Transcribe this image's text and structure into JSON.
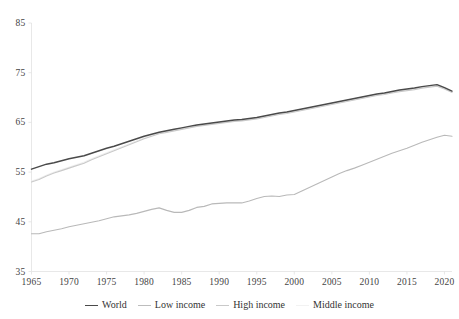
{
  "chart_data": {
    "type": "line",
    "title": "",
    "subtitle": "",
    "xlabel": "",
    "ylabel": "",
    "xlim": [
      1965,
      2021
    ],
    "ylim": [
      35,
      85
    ],
    "grid": false,
    "legend_position": "bottom",
    "x_ticks": [
      "1965",
      "1970",
      "1975",
      "1980",
      "1985",
      "1990",
      "1995",
      "2000",
      "2005",
      "2010",
      "2015",
      "2020"
    ],
    "x_tick_values": [
      1965,
      1970,
      1975,
      1980,
      1985,
      1990,
      1995,
      2000,
      2005,
      2010,
      2015,
      2020
    ],
    "y_ticks": [
      "35",
      "45",
      "55",
      "65",
      "75",
      "85"
    ],
    "y_tick_values": [
      35,
      45,
      55,
      65,
      75,
      85
    ],
    "x": [
      1965,
      1966,
      1967,
      1968,
      1969,
      1970,
      1971,
      1972,
      1973,
      1974,
      1975,
      1976,
      1977,
      1978,
      1979,
      1980,
      1981,
      1982,
      1983,
      1984,
      1985,
      1986,
      1987,
      1988,
      1989,
      1990,
      1991,
      1992,
      1993,
      1994,
      1995,
      1996,
      1997,
      1998,
      1999,
      2000,
      2001,
      2002,
      2003,
      2004,
      2005,
      2006,
      2007,
      2008,
      2009,
      2010,
      2011,
      2012,
      2013,
      2014,
      2015,
      2016,
      2017,
      2018,
      2019,
      2020,
      2021
    ],
    "series": [
      {
        "name": "World",
        "color": "#4a4a4a",
        "width": 1.5,
        "values": [
          55.6,
          56.1,
          56.6,
          56.9,
          57.3,
          57.7,
          58.0,
          58.3,
          58.8,
          59.3,
          59.8,
          60.2,
          60.7,
          61.2,
          61.7,
          62.2,
          62.6,
          63.0,
          63.3,
          63.6,
          63.9,
          64.2,
          64.5,
          64.7,
          64.9,
          65.1,
          65.3,
          65.5,
          65.6,
          65.8,
          66.0,
          66.3,
          66.6,
          66.9,
          67.1,
          67.4,
          67.7,
          68.0,
          68.3,
          68.6,
          68.9,
          69.2,
          69.5,
          69.8,
          70.1,
          70.4,
          70.7,
          70.9,
          71.2,
          71.5,
          71.7,
          71.9,
          72.2,
          72.4,
          72.6,
          72.0,
          71.3
        ]
      },
      {
        "name": "Low income",
        "color": "#b9b9b9",
        "width": 1.1,
        "values": [
          42.6,
          42.6,
          43.0,
          43.3,
          43.6,
          44.0,
          44.3,
          44.6,
          44.9,
          45.2,
          45.6,
          46.0,
          46.2,
          46.4,
          46.7,
          47.1,
          47.5,
          47.8,
          47.3,
          46.9,
          46.9,
          47.3,
          47.9,
          48.1,
          48.6,
          48.7,
          48.8,
          48.8,
          48.8,
          49.2,
          49.7,
          50.1,
          50.2,
          50.1,
          50.4,
          50.5,
          51.2,
          51.9,
          52.6,
          53.3,
          54.0,
          54.7,
          55.3,
          55.8,
          56.4,
          57.0,
          57.6,
          58.2,
          58.8,
          59.3,
          59.8,
          60.4,
          61.0,
          61.5,
          62.0,
          62.4,
          62.2
        ]
      },
      {
        "name": "High income",
        "color": "#c9c9c9",
        "width": 1.1,
        "values": [
          53.0,
          53.5,
          54.2,
          54.8,
          55.3,
          55.8,
          56.3,
          56.8,
          57.5,
          58.1,
          58.7,
          59.3,
          59.9,
          60.5,
          61.1,
          61.7,
          62.2,
          62.7,
          63.0,
          63.3,
          63.6,
          63.9,
          64.2,
          64.4,
          64.6,
          64.8,
          65.0,
          65.2,
          65.3,
          65.5,
          65.7,
          66.0,
          66.3,
          66.6,
          66.8,
          67.1,
          67.4,
          67.7,
          68.0,
          68.3,
          68.6,
          68.9,
          69.2,
          69.5,
          69.8,
          70.1,
          70.4,
          70.6,
          70.9,
          71.2,
          71.4,
          71.6,
          71.9,
          72.1,
          72.3,
          71.7,
          71.0
        ]
      },
      {
        "name": "Middle income",
        "color": "#eeeeee",
        "width": 1.0,
        "values": [
          53.2,
          53.7,
          54.4,
          55.0,
          55.5,
          56.0,
          56.5,
          57.0,
          57.7,
          58.3,
          58.9,
          59.5,
          60.1,
          60.7,
          61.3,
          61.9,
          62.4,
          62.9,
          63.2,
          63.5,
          63.8,
          64.1,
          64.4,
          64.6,
          64.8,
          65.0,
          65.2,
          65.4,
          65.5,
          65.7,
          65.9,
          66.2,
          66.5,
          66.8,
          67.0,
          67.3,
          67.6,
          67.9,
          68.2,
          68.5,
          68.8,
          69.1,
          69.4,
          69.7,
          70.0,
          70.3,
          70.6,
          70.8,
          71.1,
          71.4,
          71.6,
          71.8,
          72.1,
          72.3,
          72.5,
          71.9,
          71.2
        ]
      }
    ]
  },
  "legend": {
    "items": [
      {
        "label": "World",
        "color": "#4a4a4a"
      },
      {
        "label": "Low income",
        "color": "#bdbdbd"
      },
      {
        "label": "High income",
        "color": "#c9c9c9"
      },
      {
        "label": "Middle income",
        "color": "#f2f2f2"
      }
    ]
  },
  "axes": {
    "axis_color": "#e2e2e2",
    "tick_label_color": "#444444"
  }
}
